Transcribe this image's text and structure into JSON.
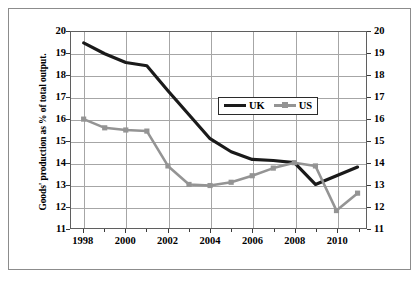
{
  "chart_data": {
    "type": "line",
    "title": "",
    "xlabel": "",
    "ylabel": "Goods' production as % of total output.",
    "xlim": [
      1997.4,
      2011.4
    ],
    "ylim": [
      11,
      20
    ],
    "ytick_labels": [
      "11",
      "12",
      "13",
      "14",
      "15",
      "16",
      "17",
      "18",
      "19",
      "20"
    ],
    "ytick_values": [
      11,
      12,
      13,
      14,
      15,
      16,
      17,
      18,
      19,
      20
    ],
    "xtick_labels": [
      "1998",
      "2000",
      "2002",
      "2004",
      "2006",
      "2008",
      "2010"
    ],
    "xtick_values": [
      1998,
      2000,
      2002,
      2004,
      2006,
      2008,
      2010
    ],
    "grid": true,
    "legend_position": "upper-center-right",
    "dual_y_axis": true,
    "x": [
      1998,
      1999,
      2000,
      2001,
      2002,
      2003,
      2004,
      2005,
      2006,
      2007,
      2008,
      2009,
      2010,
      2011
    ],
    "series": [
      {
        "name": "UK",
        "color": "#1a1a1a",
        "marker": "none",
        "values": [
          19.5,
          19.0,
          18.6,
          18.45,
          17.3,
          16.2,
          15.1,
          14.5,
          14.15,
          14.1,
          14.0,
          13.0,
          13.4,
          13.8
        ]
      },
      {
        "name": "US",
        "color": "#949494",
        "marker": "square",
        "values": [
          16.0,
          15.6,
          15.5,
          15.45,
          13.85,
          13.0,
          12.95,
          13.1,
          13.4,
          13.75,
          14.0,
          13.85,
          11.8,
          12.6
        ]
      }
    ],
    "legend": [
      "UK",
      "US"
    ]
  },
  "legend": {
    "entries": [
      {
        "label": "UK",
        "icon": "black-line-swatch"
      },
      {
        "label": "US",
        "icon": "gray-line-square-swatch"
      }
    ]
  },
  "axes": {
    "y_title": "Goods' production as % of total output."
  }
}
